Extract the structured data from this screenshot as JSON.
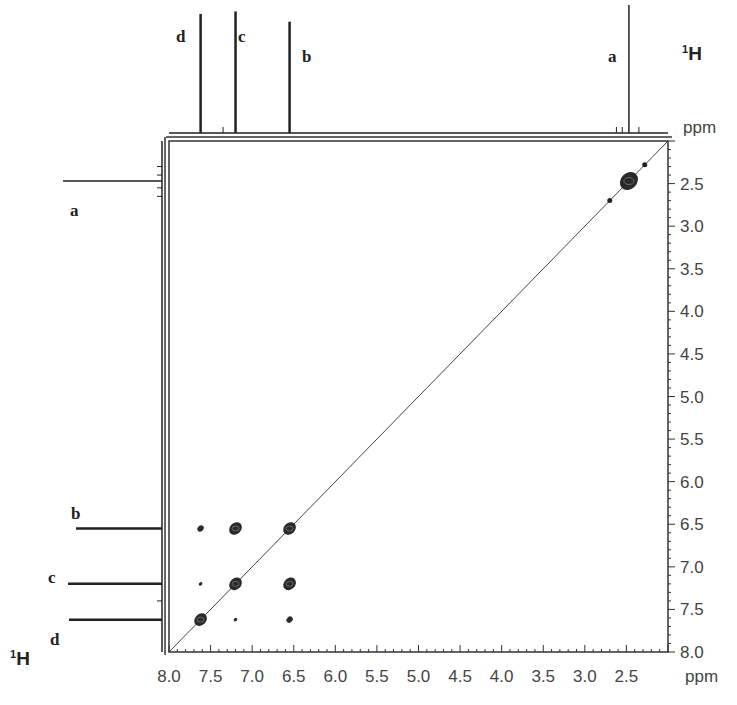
{
  "chart_data": {
    "type": "heatmap",
    "subtype": "2D NMR COSY (1H-1H) contour plot",
    "title": "",
    "xlabel": "ppm",
    "ylabel": "ppm",
    "x_nucleus_label": "1H",
    "y_nucleus_label": "1H",
    "xlim": [
      8.0,
      2.0
    ],
    "ylim": [
      2.0,
      8.0
    ],
    "x_ticks": [
      "8.0",
      "7.5",
      "7.0",
      "6.5",
      "6.0",
      "5.5",
      "5.0",
      "4.5",
      "4.0",
      "3.5",
      "3.0",
      "2.5"
    ],
    "y_ticks": [
      "2.5",
      "3.0",
      "3.5",
      "4.0",
      "4.5",
      "5.0",
      "5.5",
      "6.0",
      "6.5",
      "7.0",
      "7.5",
      "8.0"
    ],
    "grid": false,
    "projection_peaks": [
      {
        "label": "d",
        "ppm": 7.62,
        "rel_height": 0.93
      },
      {
        "label": "c",
        "ppm": 7.2,
        "rel_height": 0.95
      },
      {
        "label": "b",
        "ppm": 6.55,
        "rel_height": 0.87
      },
      {
        "label": "a",
        "ppm": 2.47,
        "rel_height": 1.0
      }
    ],
    "diagonal_peaks": [
      {
        "label": "a",
        "x": 2.47,
        "y": 2.47,
        "size": "large"
      },
      {
        "label": "b",
        "x": 6.55,
        "y": 6.55,
        "size": "medium"
      },
      {
        "label": "c",
        "x": 7.2,
        "y": 7.2,
        "size": "medium"
      },
      {
        "label": "d",
        "x": 7.62,
        "y": 7.62,
        "size": "medium"
      }
    ],
    "cross_peaks": [
      {
        "x": 7.62,
        "y": 6.55,
        "size": "small"
      },
      {
        "x": 7.2,
        "y": 6.55,
        "size": "medium"
      },
      {
        "x": 7.62,
        "y": 7.2,
        "size": "tiny"
      },
      {
        "x": 6.55,
        "y": 7.2,
        "size": "medium"
      },
      {
        "x": 7.2,
        "y": 7.62,
        "size": "tiny"
      },
      {
        "x": 6.55,
        "y": 7.62,
        "size": "small"
      }
    ],
    "minor_diagonal_dots": [
      2.28,
      2.7
    ]
  },
  "labels": {
    "top_nucleus": "1H",
    "left_nucleus": "1H",
    "x_unit": "ppm",
    "y_unit": "ppm",
    "peak_a": "a",
    "peak_b": "b",
    "peak_c": "c",
    "peak_d": "d"
  }
}
